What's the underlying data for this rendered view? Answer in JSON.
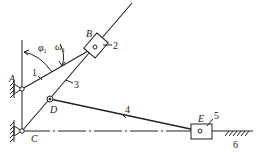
{
  "diagram": {
    "type": "planar linkage mechanism",
    "points": {
      "A": {
        "label": "A"
      },
      "B": {
        "label": "B"
      },
      "C": {
        "label": "C"
      },
      "D": {
        "label": "D"
      },
      "E": {
        "label": "E"
      }
    },
    "links": [
      {
        "id": "1",
        "label": "1"
      },
      {
        "id": "2",
        "label": "2"
      },
      {
        "id": "3",
        "label": "3"
      },
      {
        "id": "4",
        "label": "4"
      },
      {
        "id": "5",
        "label": "5"
      },
      {
        "id": "6",
        "label": "6"
      }
    ],
    "angle_label": "φ",
    "angle_sub": "1",
    "omega_label": "ω",
    "omega_sub": "1",
    "stroke_color": "#222222"
  }
}
